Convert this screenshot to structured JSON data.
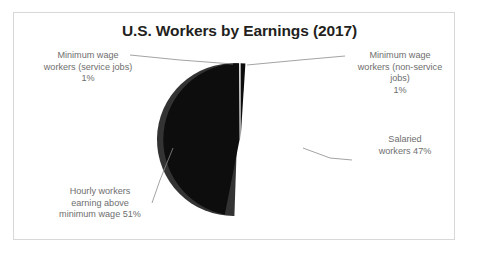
{
  "figure": {
    "title": "U.S. Workers by Earnings (2017)",
    "background_color": "#ffffff",
    "border_color": "#d8d8d8",
    "label_color": "#6e6e6e",
    "title_color": "#231f20",
    "leader_line_color": "#8c8c8c"
  },
  "labels": {
    "min_wage_service": {
      "line1": "Minimum wage",
      "line2": "workers (service jobs)",
      "line3": "1%"
    },
    "min_wage_nonservice": {
      "line1": "Minimum wage",
      "line2": "workers (non-service",
      "line3": "jobs)",
      "line4": "1%"
    },
    "salaried": {
      "line1": "Salaried",
      "line2": "workers 47%"
    },
    "hourly_above_min": {
      "line1": "Hourly workers",
      "line2": "earning above",
      "line3": "minimum wage 51%"
    }
  },
  "chart_data": {
    "type": "pie",
    "title": "U.S. Workers by Earnings (2017)",
    "xlabel": "",
    "ylabel": "",
    "grid": false,
    "legend_position": "none",
    "labels_position": "outside-with-leader-lines",
    "start_angle_deg": -90,
    "direction": "clockwise",
    "slice_gap": true,
    "categories": [
      "Hourly workers earning above minimum wage",
      "Minimum wage workers (service jobs)",
      "Minimum wage workers (non-service jobs)",
      "Salaried workers"
    ],
    "values": [
      51,
      1,
      1,
      47
    ],
    "value_unit": "percent",
    "labels": [
      "Hourly workers earning above minimum wage 51%",
      "Minimum wage workers (service jobs) 1%",
      "Minimum wage workers (non-service jobs) 1%",
      "Salaried workers 47%"
    ],
    "slices": [
      {
        "name": "Hourly workers earning above minimum wage",
        "value": 51,
        "display_value": "51%",
        "color": "#333333",
        "position": "left"
      },
      {
        "name": "Minimum wage workers (service jobs)",
        "value": 1,
        "display_value": "1%",
        "color": "#333333",
        "position": "top-left-sliver"
      },
      {
        "name": "Minimum wage workers (non-service jobs)",
        "value": 1,
        "display_value": "1%",
        "color": "#0d0d0d",
        "position": "top-right-sliver"
      },
      {
        "name": "Salaried workers",
        "value": 47,
        "display_value": "47%",
        "color": "#0d0d0d",
        "position": "right"
      }
    ],
    "total": 100
  }
}
